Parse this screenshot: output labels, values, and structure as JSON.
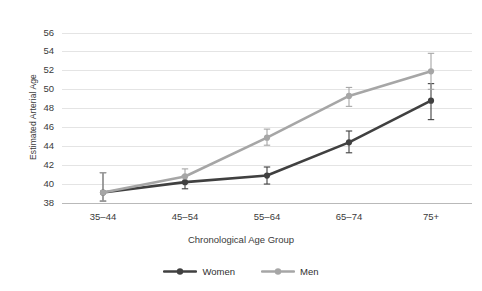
{
  "chart_data": {
    "type": "line",
    "title": "",
    "subtitle": "",
    "xlabel": "Chronological Age Group",
    "ylabel": "Estimated Arterial Age",
    "categories": [
      "35–44",
      "45–54",
      "55–64",
      "65–74",
      "75+"
    ],
    "ylim": [
      38,
      57
    ],
    "yticks": [
      38,
      40,
      42,
      44,
      46,
      48,
      50,
      52,
      54,
      56
    ],
    "ytick_labels": [
      "38",
      "40",
      "42",
      "44",
      "46",
      "48",
      "50",
      "52",
      "54",
      "56"
    ],
    "grid": "horizontal",
    "legend_position": "bottom-center",
    "series": [
      {
        "name": "Women",
        "color": "#404040",
        "values": [
          39.1,
          40.2,
          40.9,
          44.4,
          48.8
        ],
        "error_low": [
          38.2,
          39.5,
          40.0,
          43.3,
          46.8
        ],
        "error_high": [
          41.2,
          40.9,
          41.8,
          45.6,
          50.6
        ]
      },
      {
        "name": "Men",
        "color": "#a6a6a6",
        "values": [
          39.1,
          40.8,
          44.9,
          49.3,
          51.9
        ],
        "error_low": [
          38.2,
          40.1,
          44.1,
          48.2,
          50.0
        ],
        "error_high": [
          41.2,
          41.6,
          45.8,
          50.2,
          53.8
        ]
      }
    ],
    "legend": [
      "Women",
      "Men"
    ],
    "colors": {
      "women": "#404040",
      "men": "#a6a6a6",
      "grid": "#e4e4e4",
      "axis": "#b9b9b9",
      "text": "#3a3a3a",
      "background": "#ffffff"
    }
  }
}
